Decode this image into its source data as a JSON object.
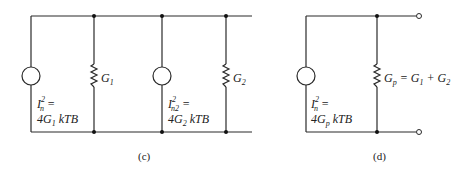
{
  "figure": {
    "panel_c": {
      "caption": "(c)",
      "source1": {
        "label_line1_main": "I",
        "label_line1_sup": "2",
        "label_line1_sub": "n",
        "label_line1_eq": " =",
        "label_line2_pre": "4G",
        "label_line2_sub": "1",
        "label_line2_post": " kTB"
      },
      "resistor1": {
        "label_main": "G",
        "label_sub": "1"
      },
      "source2": {
        "label_line1_main": "I",
        "label_line1_sup": "2",
        "label_line1_sub": "n2",
        "label_line1_eq": " =",
        "label_line2_pre": "4G",
        "label_line2_sub": "2",
        "label_line2_post": " kTB"
      },
      "resistor2": {
        "label_main": "G",
        "label_sub": "2"
      }
    },
    "panel_d": {
      "caption": "(d)",
      "source": {
        "label_line1_main": "I",
        "label_line1_sup": "2",
        "label_line1_sub": "n",
        "label_line1_eq": " =",
        "label_line2_pre": "4G",
        "label_line2_sub": "p",
        "label_line2_post": " kTB"
      },
      "resistor": {
        "label_main": "G",
        "label_sub": "p",
        "label_eq": " = G",
        "label_sub1": "1",
        "label_plus": " + G",
        "label_sub2": "2"
      }
    }
  }
}
